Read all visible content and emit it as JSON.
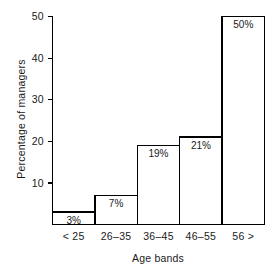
{
  "chart_data": {
    "type": "bar",
    "title": "",
    "subtitle": "",
    "xlabel": "Age bands",
    "ylabel": "Percentage of managers",
    "categories": [
      "< 25",
      "26–35",
      "36–45",
      "46–55",
      "56 >"
    ],
    "values": [
      3,
      7,
      19,
      21,
      50
    ],
    "data_labels": [
      "3%",
      "7%",
      "19%",
      "21%",
      "50%"
    ],
    "ylim": [
      0,
      50
    ],
    "yticks": [
      10,
      20,
      30,
      40,
      50
    ],
    "ytick_labels": [
      "10",
      "20",
      "30",
      "40",
      "50"
    ],
    "grid": false,
    "legend": null,
    "legend_position": "none",
    "bar_fill_color": "#ffffff",
    "bar_edge_color": "#000000",
    "axis_color": "#000000",
    "text_color": "#1a1a1a",
    "background_color": "#ffffff",
    "annotations": []
  },
  "axes": {
    "y_title": "Percentage of managers",
    "x_title": "Age bands"
  },
  "bars": [
    {
      "label": "< 25",
      "value_label": "3%",
      "value": 3
    },
    {
      "label": "26–35",
      "value_label": "7%",
      "value": 7
    },
    {
      "label": "36–45",
      "value_label": "19%",
      "value": 19
    },
    {
      "label": "46–55",
      "value_label": "21%",
      "value": 21
    },
    {
      "label": "56 >",
      "value_label": "50%",
      "value": 50
    }
  ],
  "ticks": [
    {
      "label": "50",
      "value": 50
    },
    {
      "label": "40",
      "value": 40
    },
    {
      "label": "30",
      "value": 30
    },
    {
      "label": "20",
      "value": 20
    },
    {
      "label": "10",
      "value": 10
    }
  ]
}
